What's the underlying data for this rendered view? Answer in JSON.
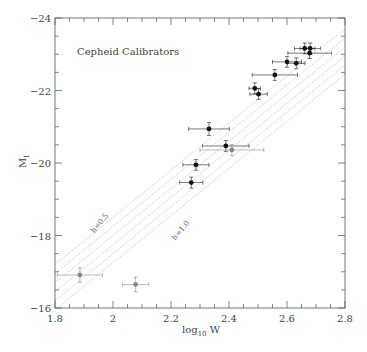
{
  "chart_data": {
    "type": "scatter",
    "title": "Cepheid Calibrators",
    "xlabel": "log10 W",
    "xlabel_main": "log",
    "xlabel_sub": "10",
    "xlabel_tail": " W",
    "ylabel": "M_I",
    "ylabel_main": "M",
    "ylabel_sub": "I",
    "xlim": [
      1.8,
      2.8
    ],
    "ylim": [
      -16,
      -24
    ],
    "y_inverted": true,
    "x_ticks": [
      "1.8",
      "2",
      "2.2",
      "2.4",
      "2.6",
      "2.8"
    ],
    "y_ticks": [
      "-16",
      "-18",
      "-20",
      "-22",
      "-24"
    ],
    "grid": false,
    "legend": null,
    "series": [
      {
        "name": "Cepheid calibrators (filled)",
        "color": "#111111",
        "points": [
          {
            "x": 2.27,
            "y": -19.46,
            "xerr": 0.04,
            "yerr": 0.15
          },
          {
            "x": 2.286,
            "y": -19.95,
            "xerr": 0.045,
            "yerr": 0.15
          },
          {
            "x": 2.331,
            "y": -20.94,
            "xerr": 0.07,
            "yerr": 0.18
          },
          {
            "x": 2.389,
            "y": -20.47,
            "xerr": 0.08,
            "yerr": 0.15
          },
          {
            "x": 2.489,
            "y": -22.06,
            "xerr": 0.02,
            "yerr": 0.15
          },
          {
            "x": 2.502,
            "y": -21.9,
            "xerr": 0.03,
            "yerr": 0.15
          },
          {
            "x": 2.558,
            "y": -22.43,
            "xerr": 0.078,
            "yerr": 0.15
          },
          {
            "x": 2.6,
            "y": -22.79,
            "xerr": 0.05,
            "yerr": 0.15
          },
          {
            "x": 2.632,
            "y": -22.75,
            "xerr": 0.03,
            "yerr": 0.15
          },
          {
            "x": 2.661,
            "y": -23.16,
            "xerr": 0.035,
            "yerr": 0.15
          },
          {
            "x": 2.68,
            "y": -23.16,
            "xerr": 0.035,
            "yerr": 0.15
          },
          {
            "x": 2.678,
            "y": -23.03,
            "xerr": 0.075,
            "yerr": 0.15
          }
        ]
      },
      {
        "name": "Cepheid calibrators (open/gray)",
        "color": "#888888",
        "points": [
          {
            "x": 1.886,
            "y": -16.91,
            "xerr": 0.078,
            "yerr": 0.2
          },
          {
            "x": 2.078,
            "y": -16.65,
            "xerr": 0.045,
            "yerr": 0.2
          },
          {
            "x": 2.41,
            "y": -20.36,
            "xerr": 0.11,
            "yerr": 0.15
          }
        ]
      }
    ],
    "reference_lines": {
      "slope": -6.5,
      "style": "dotted",
      "intercepts_at_x1_8": [
        -17.2,
        -16.95,
        -16.7,
        -16.45,
        -16.2,
        -15.95
      ],
      "labels": [
        {
          "text": "h=0.5",
          "x": 1.96,
          "y": -18.3
        },
        {
          "text": "h=1.0",
          "x": 2.24,
          "y": -18.1
        }
      ]
    }
  }
}
